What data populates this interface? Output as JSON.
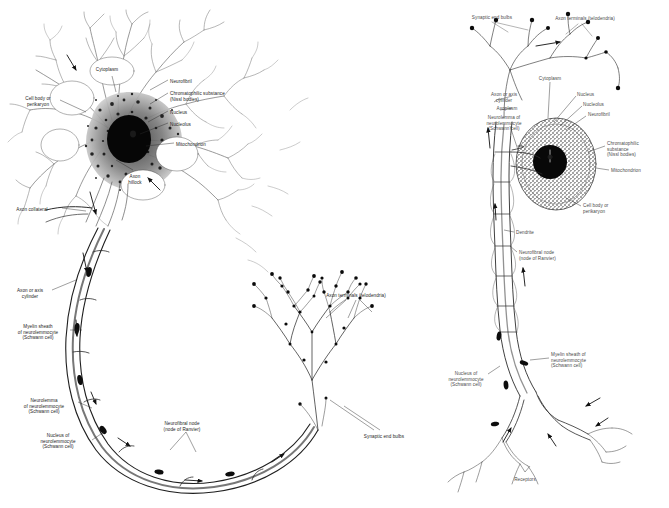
{
  "figure": {
    "background_color": "#ffffff",
    "ink_color": "#1a1a1a",
    "panels": 2
  },
  "left_panel": {
    "name": "multipolar-neuron-detail",
    "labels": [
      {
        "id": "cytoplasm",
        "text": "Cytoplasm",
        "x": 107,
        "y": 67,
        "align": "c"
      },
      {
        "id": "neurofibril",
        "text": "Neurofibril",
        "x": 170,
        "y": 79,
        "align": "l"
      },
      {
        "id": "chromatophilic",
        "text": "Chromatophilic substance\n(Nissl bodies)",
        "x": 170,
        "y": 91,
        "align": "l"
      },
      {
        "id": "nucleus",
        "text": "Nucleus",
        "x": 170,
        "y": 110,
        "align": "l"
      },
      {
        "id": "nucleolus",
        "text": "Nucleolus",
        "x": 170,
        "y": 122,
        "align": "l"
      },
      {
        "id": "mitochondrion",
        "text": "Mitochondrion",
        "x": 176,
        "y": 142,
        "align": "l"
      },
      {
        "id": "cell-body",
        "text": "Cell body or\nperikaryon",
        "x": 38,
        "y": 96,
        "align": "c"
      },
      {
        "id": "axon-hillock",
        "text": "Axon\nhillock",
        "x": 135,
        "y": 174,
        "align": "c"
      },
      {
        "id": "axon-collateral",
        "text": "Axon collateral",
        "x": 32,
        "y": 207,
        "align": "c"
      },
      {
        "id": "axon-axis-cylinder",
        "text": "Axon or axis\ncylinder",
        "x": 30,
        "y": 288,
        "align": "c"
      },
      {
        "id": "myelin-sheath",
        "text": "Myelin sheath\nof neurolemmocyte\n(Schwann cell)",
        "x": 38,
        "y": 324,
        "align": "c"
      },
      {
        "id": "neurolemma",
        "text": "Neurolemma\nof neurolemmocyte\n(Schwann cell)",
        "x": 44,
        "y": 398,
        "align": "c"
      },
      {
        "id": "nucleus-schwann",
        "text": "Nucleus of\nneurolemmocyte\n(Schwann cell)",
        "x": 58,
        "y": 433,
        "align": "c"
      },
      {
        "id": "neurofibral-node",
        "text": "Neurofibral node\n(node of Ranvier)",
        "x": 182,
        "y": 421,
        "align": "c"
      },
      {
        "id": "axon-terminals",
        "text": "Axon terminals (telodendria)",
        "x": 356,
        "y": 293,
        "align": "c"
      },
      {
        "id": "synaptic-end-bulbs",
        "text": "Synaptic end bulbs",
        "x": 384,
        "y": 434,
        "align": "c"
      }
    ]
  },
  "right_panel": {
    "name": "sensory-unipolar-neuron-overview",
    "labels": [
      {
        "id": "synaptic-end-bulbs-r",
        "text": "Synaptic end bulbs",
        "x": 492,
        "y": 15,
        "align": "c"
      },
      {
        "id": "axon-terminals-r",
        "text": "Axon terminals (telodendria)",
        "x": 585,
        "y": 16,
        "align": "c"
      },
      {
        "id": "cytoplasm-r",
        "text": "Cytoplasm",
        "x": 550,
        "y": 76,
        "align": "c"
      },
      {
        "id": "nucleus-r",
        "text": "Nucleus",
        "x": 577,
        "y": 92,
        "align": "l"
      },
      {
        "id": "nucleolus-r",
        "text": "Nucleolus",
        "x": 583,
        "y": 102,
        "align": "l"
      },
      {
        "id": "neurofibril-r",
        "text": "Neurofibril",
        "x": 588,
        "y": 112,
        "align": "l"
      },
      {
        "id": "axon-axis-cylinder-r",
        "text": "Axon or axis\ncylinder",
        "x": 504,
        "y": 92,
        "align": "c"
      },
      {
        "id": "axoplasm-r",
        "text": "Axoplasm",
        "x": 507,
        "y": 106,
        "align": "c"
      },
      {
        "id": "neurolemma-r",
        "text": "Neurolemma of\nneurolemmocyte\n(Schwann cell)",
        "x": 504,
        "y": 115,
        "align": "c"
      },
      {
        "id": "chromatophilic-r",
        "text": "Chromatophilic\nsubstance\n(Nissl bodies)",
        "x": 607,
        "y": 141,
        "align": "l"
      },
      {
        "id": "mitochondrion-r",
        "text": "Mitochondrion",
        "x": 611,
        "y": 168,
        "align": "l"
      },
      {
        "id": "cell-body-r",
        "text": "Cell body or\nperikaryon",
        "x": 583,
        "y": 203,
        "align": "l"
      },
      {
        "id": "dendrite-r",
        "text": "Dendrite",
        "x": 516,
        "y": 230,
        "align": "l"
      },
      {
        "id": "neurofibral-node-r",
        "text": "Neurofibral node\n(node of Ranvier)",
        "x": 519,
        "y": 250,
        "align": "l"
      },
      {
        "id": "myelin-sheath-r",
        "text": "Myelin sheath of\nneurolemmocyte\n(Schwann cell)",
        "x": 551,
        "y": 352,
        "align": "l"
      },
      {
        "id": "nucleus-schwann-r",
        "text": "Nucleus of\nneurolemmocyte\n(Schwann cell)",
        "x": 466,
        "y": 371,
        "align": "c"
      },
      {
        "id": "receptors-r",
        "text": "Receptors",
        "x": 525,
        "y": 477,
        "align": "c"
      }
    ]
  }
}
